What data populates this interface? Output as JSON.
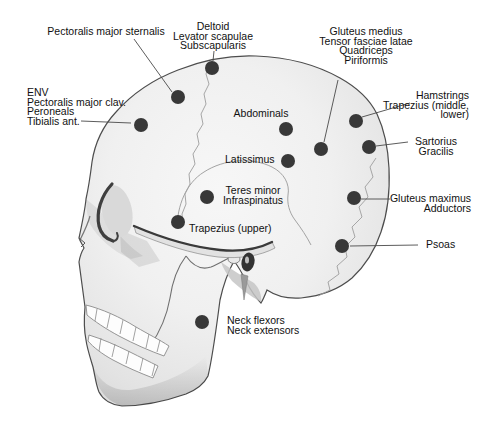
{
  "figure": {
    "colors": {
      "background": "#ffffff",
      "dot": "#383838",
      "leader": "#4a4a4a",
      "text": "#111111",
      "bone_light": "#f6f6f6",
      "bone_shadow": "#d6d6d6",
      "outline": "#4d4d4d"
    },
    "dot_radius": 7,
    "markers": [
      {
        "id": "pectoralis-major-sternalis",
        "label": [
          "Pectoralis major sternalis"
        ],
        "align": "center",
        "tx": 106,
        "ty": 35,
        "dot": [
          178,
          97
        ],
        "leader": [
          134,
          39,
          172,
          92
        ]
      },
      {
        "id": "deltoid-group",
        "label": [
          "Deltoid",
          "Levator scapulae",
          "Subscapularis"
        ],
        "align": "center",
        "tx": 213,
        "ty": 30,
        "dot": [
          212,
          68
        ],
        "leader": [
          214,
          51,
          213,
          61
        ]
      },
      {
        "id": "gluteus-medius-group",
        "label": [
          "Gluteus medius",
          "Tensor fasciae latae",
          "Quadriceps",
          "Piriformis"
        ],
        "align": "center",
        "tx": 366,
        "ty": 35,
        "dot": [
          321,
          149
        ],
        "leader": [
          338,
          80,
          324,
          142
        ]
      },
      {
        "id": "env-group",
        "label": [
          "ENV",
          "Pectoralis major clav.",
          "Peroneals",
          "Tibialis ant."
        ],
        "align": "left",
        "tx": 27,
        "ty": 96,
        "dot": [
          141,
          125
        ],
        "leader": [
          81,
          121,
          131,
          123
        ]
      },
      {
        "id": "hamstrings-group",
        "label": [
          "Hamstrings",
          "Trapezius (middle,",
          "lower)"
        ],
        "align": "right",
        "tx": 469,
        "ty": 99,
        "dot": [
          356,
          121
        ],
        "leader": [
          410,
          103,
          362,
          117
        ]
      },
      {
        "id": "abdominals",
        "label": [
          "Abdominals"
        ],
        "align": "center",
        "tx": 261,
        "ty": 117,
        "dot": [
          286,
          129
        ],
        "leader": null
      },
      {
        "id": "latissimus",
        "label": [
          "Latissimus"
        ],
        "align": "left",
        "tx": 225,
        "ty": 163,
        "dot": [
          288,
          161
        ],
        "leader": null
      },
      {
        "id": "sartorius-group",
        "label": [
          "Sartorius",
          "Gracilis"
        ],
        "align": "center",
        "tx": 436,
        "ty": 145,
        "dot": [
          369,
          147
        ],
        "leader": [
          408,
          142,
          376,
          146
        ]
      },
      {
        "id": "teres-minor-group",
        "label": [
          "Teres minor",
          "Infraspinatus"
        ],
        "align": "center",
        "tx": 253,
        "ty": 194,
        "dot": [
          207,
          197
        ],
        "leader": null
      },
      {
        "id": "gluteus-maximus-group",
        "label": [
          "Gluteus maximus",
          "Adductors"
        ],
        "align": "right",
        "tx": 471,
        "ty": 202,
        "dot": [
          354,
          198
        ],
        "leader": [
          390,
          199,
          361,
          199
        ]
      },
      {
        "id": "trapezius-upper",
        "label": [
          "Trapezius (upper)"
        ],
        "align": "left",
        "tx": 189,
        "ty": 232,
        "dot": [
          178,
          222
        ],
        "leader": null
      },
      {
        "id": "psoas",
        "label": [
          "Psoas"
        ],
        "align": "left",
        "tx": 426,
        "ty": 248,
        "dot": [
          342,
          246
        ],
        "leader": [
          418,
          245,
          350,
          246
        ]
      },
      {
        "id": "neck-group",
        "label": [
          "Neck flexors",
          "Neck extensors"
        ],
        "align": "left",
        "tx": 227,
        "ty": 324,
        "dot": [
          202,
          322
        ],
        "leader": null
      }
    ]
  }
}
